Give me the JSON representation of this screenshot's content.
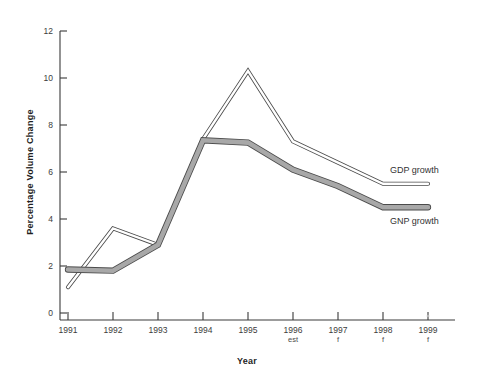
{
  "chart_data": {
    "type": "line",
    "title": "",
    "xlabel": "Year",
    "ylabel": "Percentage Volume Change",
    "categories": [
      "1991",
      "1992",
      "1993",
      "1994",
      "1995",
      "1996",
      "1997",
      "1998",
      "1999"
    ],
    "category_sublabels": [
      "",
      "",
      "",
      "",
      "",
      "est",
      "f",
      "f",
      "f"
    ],
    "ylim": [
      0,
      12
    ],
    "yticks": [
      0,
      2,
      4,
      6,
      8,
      10,
      12
    ],
    "grid": false,
    "legend_position": "inline-right",
    "series": [
      {
        "name": "GDP growth",
        "values": [
          1.1,
          3.6,
          2.9,
          7.4,
          10.3,
          7.3,
          6.4,
          5.5,
          5.5
        ],
        "color": "#ffffff",
        "outline_color": "#4b4b4b",
        "style": "thin-outlined-ribbon"
      },
      {
        "name": "GNP growth",
        "values": [
          1.85,
          1.8,
          2.9,
          7.35,
          7.25,
          6.1,
          5.4,
          4.5,
          4.5
        ],
        "color": "#a8a8a8",
        "outline_color": "#4b4b4b",
        "style": "thick-grey-ribbon"
      }
    ]
  },
  "axes": {
    "y_title": "Percentage Volume Change",
    "x_title": "Year",
    "y_tick_labels": [
      "0",
      "2",
      "4",
      "6",
      "8",
      "10",
      "12"
    ],
    "x_tick_labels": [
      "1991",
      "1992",
      "1993",
      "1994",
      "1995",
      "1996",
      "1997",
      "1998",
      "1999"
    ],
    "x_tick_sublabels": [
      "",
      "",
      "",
      "",
      "",
      "est",
      "f",
      "f",
      "f"
    ]
  },
  "series_labels": {
    "gdp": "GDP growth",
    "gnp": "GNP growth"
  },
  "colors": {
    "axis": "#3a3a3a",
    "text": "#2b2b2b",
    "gdp_fill": "#ffffff",
    "gnp_fill": "#a8a8a8",
    "outline": "#4b4b4b",
    "background": "#ffffff"
  }
}
